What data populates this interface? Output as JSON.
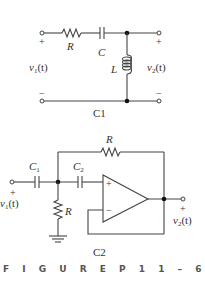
{
  "figure": {
    "caption": "FIGURE P11-65",
    "caption_text": "F I G U R E   P 1 1 – 6 5"
  },
  "circuits": [
    {
      "id": "C1",
      "label": "C1",
      "components": {
        "resistor": "R",
        "capacitor": "C",
        "inductor": "L"
      },
      "input": {
        "voltage": "v1(t)",
        "plus": "+",
        "minus": "−"
      },
      "output": {
        "voltage": "v2(t)",
        "plus": "+",
        "minus": "−"
      }
    },
    {
      "id": "C2",
      "label": "C2",
      "components": {
        "capacitor_1": "C",
        "capacitor_1_sub": "1",
        "capacitor_2": "C",
        "capacitor_2_sub": "2",
        "feedback_resistor": "R",
        "shunt_resistor": "R",
        "opamp_plus": "+",
        "opamp_minus": "−"
      },
      "input": {
        "voltage": "v1(t)",
        "plus": "+"
      },
      "output": {
        "voltage": "v2(t)",
        "plus": "+"
      }
    }
  ],
  "text": {
    "v": "v",
    "sub1": "1",
    "sub2": "2",
    "t_arg": "(t)"
  }
}
